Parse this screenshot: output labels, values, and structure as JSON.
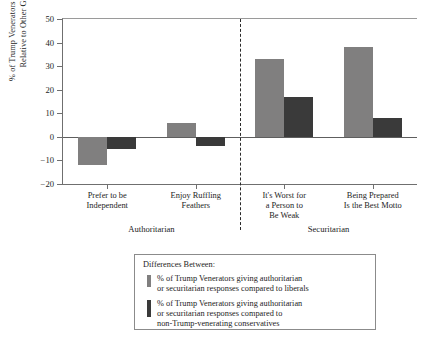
{
  "chart_data": {
    "type": "bar",
    "title": "",
    "xlabel": "",
    "ylabel": "% of Trump Venerators Agreeing Relative to Other Groups",
    "ylim": [
      -20,
      50
    ],
    "yticks": [
      50,
      40,
      30,
      20,
      10,
      0,
      -10,
      -20
    ],
    "ytick_labels": [
      "50",
      "40",
      "30",
      "20",
      "10",
      "0",
      "−10",
      "−20"
    ],
    "grid": false,
    "legend_position": "below-plot",
    "categories": [
      "Prefer to be Independent",
      "Enjoy Ruffling Feathers",
      "It's Worst for a Person to Be Weak",
      "Being Prepared Is the Best Motto"
    ],
    "category_lines": [
      [
        "Prefer to be",
        "Independent"
      ],
      [
        "Enjoy Ruffling",
        "Feathers"
      ],
      [
        "It's Worst for",
        "a Person to",
        "Be Weak"
      ],
      [
        "Being Prepared",
        "Is the Best Motto"
      ]
    ],
    "group_labels": [
      "Authoritarian",
      "Securitarian"
    ],
    "divider": {
      "after_category_index": 1,
      "style": "dashed"
    },
    "series": [
      {
        "name": "% of Trump Venerators giving authoritarian or securitarian responses compared to liberals",
        "color": "#807f7f",
        "values": [
          -12,
          6,
          33,
          38
        ]
      },
      {
        "name": "% of Trump Venerators giving authoritarian or securitarian responses compared to non-Trump-venerating conservatives",
        "color": "#3a3a3a",
        "values": [
          -5,
          -4,
          17,
          8
        ]
      }
    ]
  },
  "yaxis_title_lines": [
    "% of Trump Venerators Agreeing",
    "Relative to Other Groups"
  ],
  "legend": {
    "title": "Differences Between:",
    "entries": [
      {
        "color": "#807f7f",
        "lines": [
          "% of Trump Venerators giving authoritarian",
          "or securitarian responses compared to liberals"
        ]
      },
      {
        "color": "#3a3a3a",
        "lines": [
          "% of Trump Venerators giving authoritarian",
          "or securitarian responses compared to",
          "non-Trump-venerating conservatives"
        ]
      }
    ]
  }
}
